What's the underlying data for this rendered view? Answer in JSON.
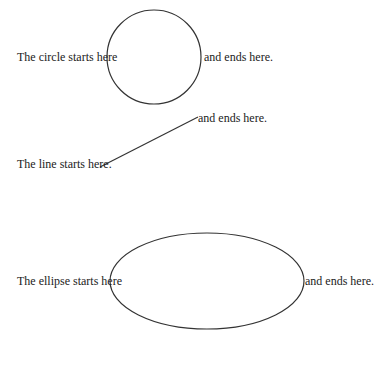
{
  "circle": {
    "start_text": "The circle starts here",
    "end_text": "and ends here.",
    "cx": 154,
    "cy": 57,
    "r": 47
  },
  "line": {
    "start_text": "The line starts here.",
    "end_text": "and ends here.",
    "x1": 100,
    "y1": 167,
    "x2": 198,
    "y2": 117
  },
  "ellipse": {
    "start_text": "The ellipse starts here",
    "end_text": "and ends here.",
    "cx": 207,
    "cy": 281,
    "rx": 97,
    "ry": 48
  },
  "stroke_color": "#333333"
}
